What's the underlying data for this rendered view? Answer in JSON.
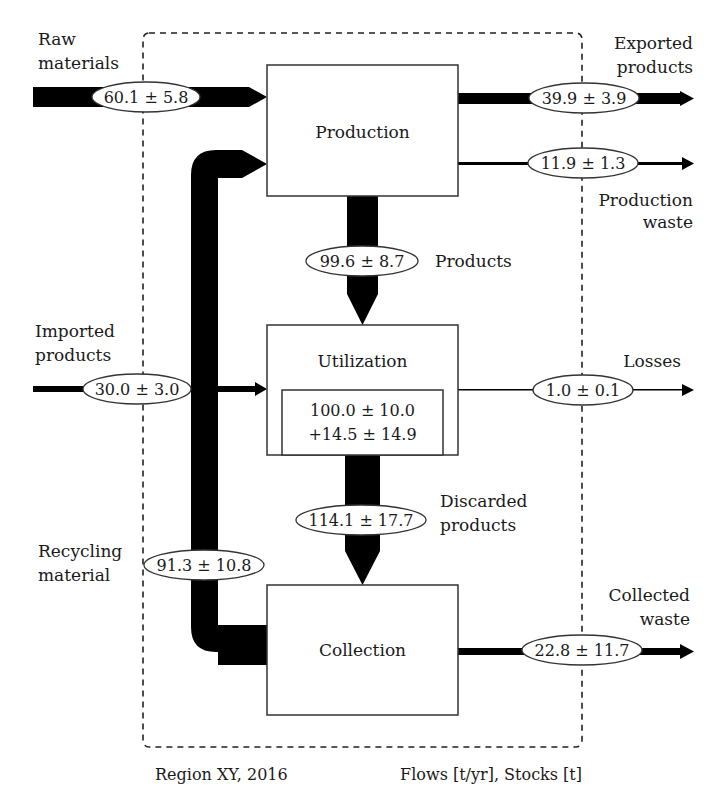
{
  "system": {
    "region_label": "Region XY, 2016",
    "units_label": "Flows [t/yr], Stocks [t]"
  },
  "processes": {
    "production": {
      "label": "Production"
    },
    "utilization": {
      "label": "Utilization",
      "stock_line1": "100.0 ± 10.0",
      "stock_line2": "+14.5 ± 14.9"
    },
    "collection": {
      "label": "Collection"
    }
  },
  "flows": {
    "raw_materials": {
      "label_line1": "Raw",
      "label_line2": "materials",
      "value": "60.1 ± 5.8"
    },
    "exported_products": {
      "label_line1": "Exported",
      "label_line2": "products",
      "value": "39.9 ± 3.9"
    },
    "production_waste": {
      "label_line1": "Production",
      "label_line2": "waste",
      "value": "11.9 ± 1.3"
    },
    "products": {
      "label": "Products",
      "value": "99.6 ± 8.7"
    },
    "imported_products": {
      "label_line1": "Imported",
      "label_line2": "products",
      "value": "30.0 ± 3.0"
    },
    "losses": {
      "label": "Losses",
      "value": "1.0 ± 0.1"
    },
    "discarded_products": {
      "label_line1": "Discarded",
      "label_line2": "products",
      "value": "114.1 ± 17.7"
    },
    "recycling_material": {
      "label_line1": "Recycling",
      "label_line2": "material",
      "value": "91.3 ± 10.8"
    },
    "collected_waste": {
      "label_line1": "Collected",
      "label_line2": "waste",
      "value": "22.8 ± 11.7"
    }
  },
  "colors": {
    "flow": "#000000",
    "box_stroke": "#333333",
    "text": "#1a1a1a",
    "background": "#ffffff"
  }
}
